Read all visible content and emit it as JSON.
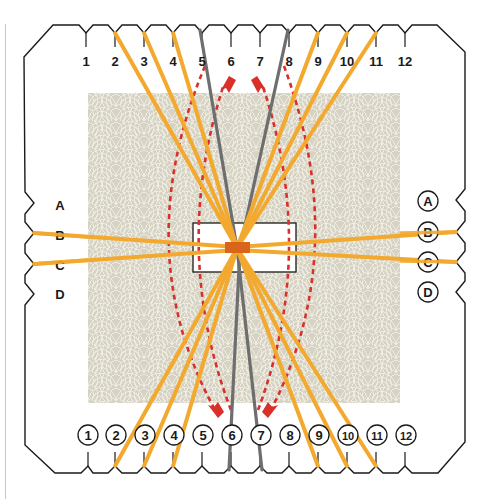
{
  "diagram": {
    "top_labels": [
      "1",
      "2",
      "3",
      "4",
      "5",
      "6",
      "7",
      "8",
      "9",
      "10",
      "11",
      "12"
    ],
    "bottom_labels": [
      "1",
      "2",
      "3",
      "4",
      "5",
      "6",
      "7",
      "8",
      "9",
      "10",
      "11",
      "12"
    ],
    "left_labels": [
      "A",
      "B",
      "C",
      "D"
    ],
    "right_labels": [
      "A",
      "B",
      "C",
      "D"
    ],
    "threads": {
      "yellow_diagonal": [
        {
          "from": "top-2",
          "to": "bottom-11"
        },
        {
          "from": "top-3",
          "to": "bottom-10"
        },
        {
          "from": "top-4",
          "to": "bottom-9"
        },
        {
          "from": "top-9",
          "to": "bottom-4"
        },
        {
          "from": "top-10",
          "to": "bottom-3"
        },
        {
          "from": "top-11",
          "to": "bottom-2"
        }
      ],
      "gray": [
        {
          "from": "top-5",
          "to": "bottom-7"
        },
        {
          "from": "top-8",
          "to": "bottom-6"
        }
      ],
      "yellow_horizontal": [
        {
          "from": "left-B",
          "to": "right-B"
        },
        {
          "from": "left-C",
          "to": "right-C"
        }
      ]
    },
    "moves": [
      {
        "from": "top-5",
        "to": "bottom-6",
        "style": "red-dashed-arrow"
      },
      {
        "from": "bottom-6",
        "to": "top-6",
        "style": "red-dashed-arrow"
      },
      {
        "from": "top-8",
        "to": "bottom-7",
        "style": "red-dashed-arrow"
      },
      {
        "from": "bottom-7",
        "to": "top-7",
        "style": "red-dashed-arrow"
      }
    ],
    "colors": {
      "yellow_thread": "#f2a92e",
      "gray_thread": "#6e6e6e",
      "arrow_red": "#d9302a",
      "center_knot": "#d9651a",
      "card_outline": "#1a1a1a",
      "texture_bg": "#d6d3c5"
    }
  }
}
